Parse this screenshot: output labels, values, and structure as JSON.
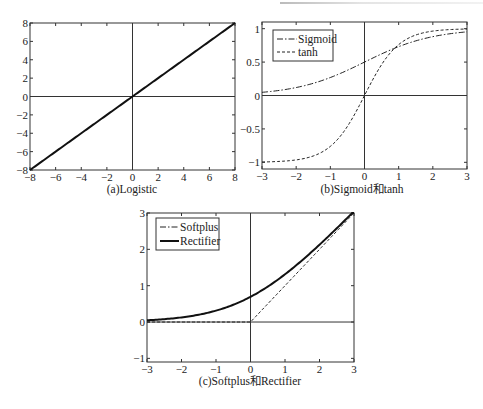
{
  "chart_data": [
    {
      "id": "a",
      "type": "line",
      "title": "(a)Logistic",
      "xlabel": "",
      "ylabel": "",
      "xlim": [
        -8,
        8
      ],
      "ylim": [
        -8,
        8
      ],
      "xticks": [
        -8,
        -6,
        -4,
        -2,
        0,
        2,
        4,
        6,
        8
      ],
      "yticks": [
        -8,
        -6,
        -4,
        -2,
        0,
        2,
        4,
        6,
        8
      ],
      "grid": false,
      "axes_through_origin": true,
      "legend": null,
      "series": [
        {
          "name": "Logistic (linear)",
          "style": "solid-thick",
          "fn": "identity",
          "x": [
            -8,
            -4,
            0,
            4,
            8
          ],
          "y": [
            -8,
            -4,
            0,
            4,
            8
          ]
        }
      ]
    },
    {
      "id": "b",
      "type": "line",
      "title": "(b)Sigmoid和tanh",
      "xlabel": "",
      "ylabel": "",
      "xlim": [
        -3,
        3
      ],
      "ylim": [
        -1.1,
        1.1
      ],
      "xticks": [
        -3,
        -2,
        -1,
        0,
        1,
        2,
        3
      ],
      "yticks": [
        -1,
        -0.5,
        0,
        0.5,
        1
      ],
      "ytick_labels": [
        "-1",
        "-0.5",
        "0",
        "0.5",
        "1"
      ],
      "grid": false,
      "axes_through_origin": true,
      "legend": {
        "position": "upper-left",
        "entries": [
          "Sigmoid",
          "tanh"
        ]
      },
      "series": [
        {
          "name": "Sigmoid",
          "style": "dash-dot",
          "fn": "sigmoid",
          "x": [
            -3,
            -2,
            -1,
            0,
            1,
            2,
            3
          ],
          "y": [
            0.047,
            0.119,
            0.269,
            0.5,
            0.731,
            0.881,
            0.953
          ]
        },
        {
          "name": "tanh",
          "style": "dashed",
          "fn": "tanh",
          "x": [
            -3,
            -2,
            -1,
            0,
            1,
            2,
            3
          ],
          "y": [
            -0.995,
            -0.964,
            -0.762,
            0,
            0.762,
            0.964,
            0.995
          ]
        }
      ]
    },
    {
      "id": "c",
      "type": "line",
      "title": "(c)Softplus和Rectifier",
      "xlabel": "",
      "ylabel": "",
      "xlim": [
        -3,
        3
      ],
      "ylim": [
        -1.1,
        3
      ],
      "xticks": [
        -3,
        -2,
        -1,
        0,
        1,
        2,
        3
      ],
      "yticks": [
        -1,
        0,
        1,
        2,
        3
      ],
      "grid": false,
      "axes_through_origin": true,
      "legend": {
        "position": "upper-left",
        "entries": [
          "Softplus",
          "Rectifier"
        ]
      },
      "series": [
        {
          "name": "Softplus",
          "style": "dash-dot",
          "legend_style": "dash-dot",
          "drawn_as": "dashed",
          "fn": "relu",
          "x": [
            -3,
            0,
            3
          ],
          "y": [
            0,
            0,
            3
          ]
        },
        {
          "name": "Rectifier",
          "style": "solid-thick",
          "legend_style": "solid-thick",
          "fn": "softplus",
          "x": [
            -3,
            -2,
            -1,
            0,
            1,
            2,
            3
          ],
          "y": [
            0.049,
            0.127,
            0.313,
            0.693,
            1.313,
            2.127,
            3.049
          ]
        }
      ]
    }
  ]
}
